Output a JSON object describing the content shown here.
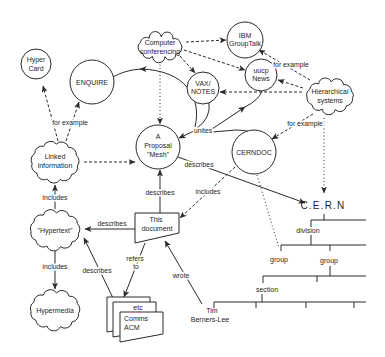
{
  "diagram": {
    "nodes": {
      "hypercard": {
        "lines": [
          "Hyper",
          "Card"
        ]
      },
      "enquire": {
        "lines": [
          "ENQUIRE"
        ]
      },
      "computer_conferencing": {
        "lines": [
          "Computer",
          "conferencing"
        ]
      },
      "ibm_grouptalk": {
        "lines": [
          "IBM",
          "GroupTalk"
        ]
      },
      "uucp_news": {
        "lines": [
          "uucp",
          "News"
        ]
      },
      "vax_notes": {
        "lines": [
          "VAX/",
          "NOTES"
        ]
      },
      "hierarchical_systems": {
        "lines": [
          "Hierarchical",
          "systems"
        ]
      },
      "mesh": {
        "lines": [
          "A",
          "Proposal",
          "\"Mesh\""
        ]
      },
      "cerndoc": {
        "lines": [
          "CERNDOC"
        ]
      },
      "linked_information": {
        "lines": [
          "Linked",
          "information"
        ]
      },
      "hypertext": {
        "lines": [
          "\"Hypertext\""
        ]
      },
      "hypermedia": {
        "lines": [
          "Hypermedia"
        ]
      },
      "this_document": {
        "lines": [
          "This",
          "document"
        ]
      },
      "document_stack": {
        "lines": [
          "etc",
          "Comms",
          "ACM"
        ]
      },
      "person": {
        "lines": [
          "Tim",
          "Berners-Lee"
        ]
      }
    },
    "edge_labels": {
      "linked_for_example": "for example",
      "hierarchical_for_example_top": "for example",
      "hierarchical_for_example_bottom": "for example",
      "hypertext_includes_linked": "includes",
      "hypertext_includes_hypermedia": "includes",
      "cerndoc_includes_document": "includes",
      "document_describes_mesh": "describes",
      "document_describes_hypertext": "describes",
      "stack_describes_hypertext": "describes",
      "mesh_describes_cern": "describes",
      "unites": "unites",
      "refers_line1": "refers",
      "refers_line2": "to",
      "wrote": "wrote"
    },
    "hierarchy": {
      "root": "C.E.R.N",
      "division": "division",
      "group_left": "group",
      "group_right": "group",
      "section": "section"
    }
  }
}
